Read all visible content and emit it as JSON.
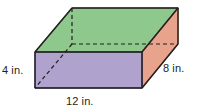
{
  "figure": {
    "name": "rectangular-prism",
    "type": "3d-solid-diagram",
    "unit": "in.",
    "faces": {
      "top": {
        "name": "top-face",
        "color": "#8fc88c",
        "stroke": "#3a5d3a"
      },
      "front": {
        "name": "front-face",
        "color": "#afa3ce",
        "stroke": "#3c3560"
      },
      "right": {
        "name": "right-face",
        "color": "#e8a38c",
        "stroke": "#7a4434"
      }
    },
    "edges": {
      "solid_stroke": "#231f20",
      "hidden_stroke": "#231f20",
      "hidden_dash": "4 3"
    }
  },
  "labels": {
    "height": "4 in.",
    "width": "12 in.",
    "depth": "8 in."
  },
  "measurements": {
    "height_value": 4,
    "width_value": 12,
    "depth_value": 8,
    "unit": "in."
  }
}
